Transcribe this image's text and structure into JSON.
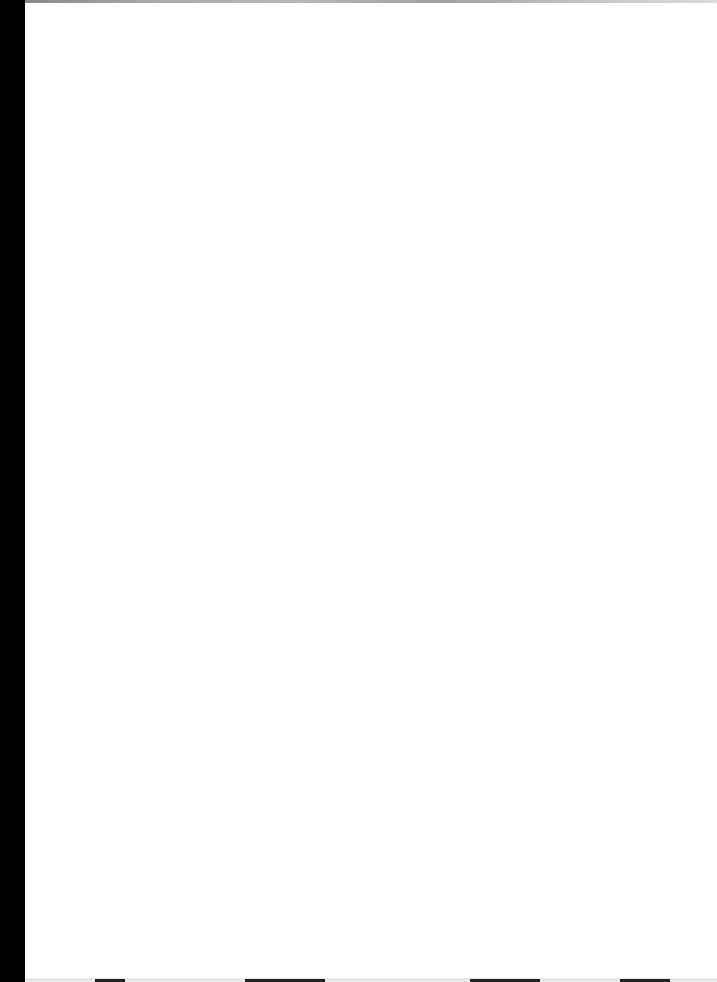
{
  "document": {
    "type": "scanned-page",
    "content": "",
    "background_color": "#ffffff",
    "scan_edge_color": "#000000"
  }
}
